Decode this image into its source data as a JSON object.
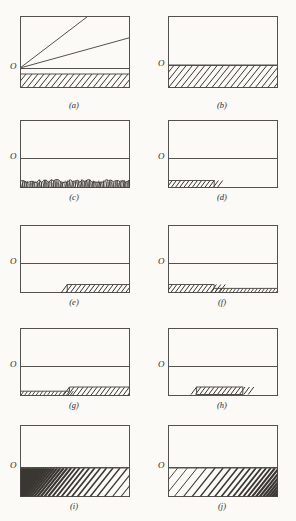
{
  "figure": {
    "page_background": "#fbfaf7",
    "ink_color": "#55514c",
    "hatch_color": "#3a3733",
    "panel_count": 10,
    "origin_label": "O"
  },
  "panels": [
    {
      "id": "a",
      "caption": "(a)",
      "origin_label": "O",
      "description": "Rectangular frame with horizontal axis line near the bottom; two straight rays rise from the origin O, a steep one reaching the top edge and a shallow one reaching the right edge, crossing each other; a uniformly hatched band fills the strip below the axis line down to the frame base.",
      "hatch_style": "uniform-diagonal",
      "hatch_density": "medium",
      "hatch_region": "full-width-band-below-axis",
      "gap_between_axis_and_hatch": true,
      "lines": [
        {
          "name": "steep-ray",
          "from": "origin",
          "to": "top-edge"
        },
        {
          "name": "shallow-ray",
          "from": "origin",
          "to": "right-edge"
        }
      ]
    },
    {
      "id": "b",
      "caption": "(b)",
      "origin_label": "O",
      "description": "Rectangular frame with the axis line at the top of a full-width uniformly hatched band that extends to the frame base; no gap.",
      "hatch_style": "uniform-diagonal",
      "hatch_density": "medium",
      "hatch_region": "full-width-band-touching-axis",
      "gap_between_axis_and_hatch": false,
      "lines": []
    },
    {
      "id": "c",
      "caption": "(c)",
      "origin_label": "O",
      "description": "Rectangular frame with axis line; beneath it a thin full-width band of very fine, dense, irregular zig-zag hatching whose upper boundary is rough and wavy.",
      "hatch_style": "fine-irregular-zigzag",
      "hatch_density": "very-dense",
      "hatch_region": "full-width-rough-topped-band",
      "gap_between_axis_and_hatch": true,
      "lines": []
    },
    {
      "id": "d",
      "caption": "(d)",
      "origin_label": "O",
      "description": "Rectangular frame with axis line; a short hatched block occupies only the left portion of the strip below the axis, ending abruptly about one third across.",
      "hatch_style": "uniform-diagonal",
      "hatch_density": "medium",
      "hatch_region": "left-third-block",
      "gap_between_axis_and_hatch": true,
      "lines": []
    },
    {
      "id": "e",
      "caption": "(e)",
      "origin_label": "O",
      "description": "Rectangular frame with axis line; a hatched block occupies only the right portion of the strip below the axis, starting about halfway across and running to the right edge.",
      "hatch_style": "uniform-diagonal",
      "hatch_density": "medium",
      "hatch_region": "right-half-block",
      "gap_between_axis_and_hatch": true,
      "lines": []
    },
    {
      "id": "f",
      "caption": "(f)",
      "origin_label": "O",
      "description": "Rectangular frame with axis line; a stepped hatched profile, taller on the left half and dropping to a shorter hatched band across the right half.",
      "hatch_style": "uniform-diagonal",
      "hatch_density": "medium",
      "hatch_region": "stepped-tall-left-short-right",
      "gap_between_axis_and_hatch": true,
      "lines": []
    },
    {
      "id": "g",
      "caption": "(g)",
      "origin_label": "O",
      "description": "Rectangular frame with axis line; a stepped hatched profile, shorter on the left half and stepping up to a taller hatched band across the right half.",
      "hatch_style": "uniform-diagonal",
      "hatch_density": "medium",
      "hatch_region": "stepped-short-left-tall-right",
      "gap_between_axis_and_hatch": true,
      "lines": []
    },
    {
      "id": "h",
      "caption": "(h)",
      "origin_label": "O",
      "description": "Rectangular frame with axis line; a small isolated hatched block sits in the middle of the strip below the axis, not touching either side.",
      "hatch_style": "uniform-diagonal",
      "hatch_density": "medium",
      "hatch_region": "centered-isolated-block",
      "gap_between_axis_and_hatch": true,
      "lines": []
    },
    {
      "id": "i",
      "caption": "(i)",
      "origin_label": "O",
      "description": "Rectangular frame with axis line; a full-width hatched band whose line density is heaviest at the left edge and thins progressively toward the right.",
      "hatch_style": "graded-diagonal",
      "hatch_density": "dense-left-to-sparse-right",
      "hatch_region": "full-width-band-touching-axis",
      "gap_between_axis_and_hatch": false,
      "lines": []
    },
    {
      "id": "j",
      "caption": "(j)",
      "origin_label": "O",
      "description": "Rectangular frame with axis line; a full-width hatched band whose line density is lightest at the left edge and thickens progressively toward the right.",
      "hatch_style": "graded-diagonal",
      "hatch_density": "sparse-left-to-dense-right",
      "hatch_region": "full-width-band-touching-axis",
      "gap_between_axis_and_hatch": false,
      "lines": []
    }
  ]
}
